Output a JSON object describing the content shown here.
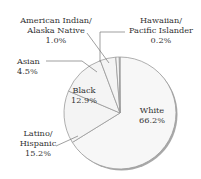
{
  "chart_data": {
    "type": "pie",
    "title": "",
    "start_angle": "12 o'clock, clockwise",
    "slices": [
      {
        "label": "White",
        "value": 66.2,
        "display": "66.2%",
        "color": "#f7f7f7"
      },
      {
        "label": "Latino/ Hispanic",
        "value": 15.2,
        "display": "15.2%",
        "color": "#f4f4f4"
      },
      {
        "label": "Black",
        "value": 12.9,
        "display": "12.9%",
        "color": "#f4f4f4"
      },
      {
        "label": "Asian",
        "value": 4.5,
        "display": "4.5%",
        "color": "#f4f4f4"
      },
      {
        "label": "American Indian/ Alaska Native",
        "value": 1.0,
        "display": "1.0%",
        "color": "#f4f4f4"
      },
      {
        "label": "Hawaiian/ Pacific Islander",
        "value": 0.2,
        "display": "0.2%",
        "color": "#f4f4f4"
      }
    ],
    "categories": [
      "White",
      "Latino/Hispanic",
      "Black",
      "Asian",
      "American Indian/Alaska Native",
      "Hawaiian/Pacific Islander"
    ],
    "values": [
      66.2,
      15.2,
      12.9,
      4.5,
      1.0,
      0.2
    ],
    "legend": "none (direct labels)"
  },
  "labels": {
    "white": {
      "line1": "White",
      "line2": "66.2%"
    },
    "latino": {
      "line1": "Latino/",
      "line2": "Hispanic",
      "line3": "15.2%"
    },
    "black": {
      "line1": "Black",
      "line2": "12.9%"
    },
    "asian": {
      "line1": "Asian",
      "line2": "4.5%"
    },
    "amind": {
      "line1": "American Indian/",
      "line2": "Alaska Native",
      "line3": "1.0%"
    },
    "hawaiian": {
      "line1": "Hawaiian/",
      "line2": "Pacific Islander",
      "line3": "0.2%"
    }
  },
  "colors": {
    "edge": "#9a9a9a",
    "shadow": "#a8a8a8",
    "fill": "#f6f6f6",
    "text": "#333333"
  }
}
